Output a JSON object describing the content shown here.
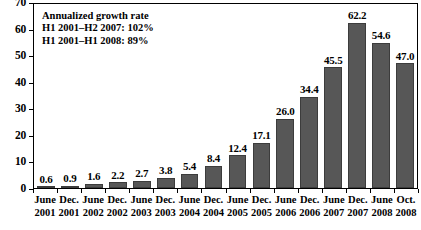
{
  "chart_data": {
    "type": "bar",
    "title": "",
    "xlabel": "",
    "ylabel": "",
    "ylim": [
      0,
      70
    ],
    "yticks": [
      0,
      10,
      20,
      30,
      40,
      50,
      60,
      70
    ],
    "grid": false,
    "legend": null,
    "categories": [
      "June 2001",
      "Dec. 2001",
      "June 2002",
      "Dec. 2002",
      "June 2003",
      "Dec. 2003",
      "June 2004",
      "Dec. 2004",
      "June 2005",
      "Dec. 2005",
      "June 2006",
      "Dec. 2006",
      "June 2007",
      "Dec. 2007",
      "June 2008",
      "Oct. 2008"
    ],
    "category_parts": [
      {
        "month": "June",
        "year": "2001"
      },
      {
        "month": "Dec.",
        "year": "2001"
      },
      {
        "month": "June",
        "year": "2002"
      },
      {
        "month": "Dec.",
        "year": "2002"
      },
      {
        "month": "June",
        "year": "2003"
      },
      {
        "month": "Dec.",
        "year": "2003"
      },
      {
        "month": "June",
        "year": "2004"
      },
      {
        "month": "Dec.",
        "year": "2004"
      },
      {
        "month": "June",
        "year": "2005"
      },
      {
        "month": "Dec.",
        "year": "2005"
      },
      {
        "month": "June",
        "year": "2006"
      },
      {
        "month": "Dec.",
        "year": "2006"
      },
      {
        "month": "June",
        "year": "2007"
      },
      {
        "month": "Dec.",
        "year": "2007"
      },
      {
        "month": "June",
        "year": "2008"
      },
      {
        "month": "Oct.",
        "year": "2008"
      }
    ],
    "values": [
      0.6,
      0.9,
      1.6,
      2.2,
      2.7,
      3.8,
      5.4,
      8.4,
      12.4,
      17.1,
      26.0,
      34.4,
      45.5,
      62.2,
      54.6,
      47.0
    ],
    "value_labels": [
      "0.6",
      "0.9",
      "1.6",
      "2.2",
      "2.7",
      "3.8",
      "5.4",
      "8.4",
      "12.4",
      "17.1",
      "26.0",
      "34.4",
      "45.5",
      "62.2",
      "54.6",
      "47.0"
    ],
    "annotations": [
      "Annualized growth rate",
      "H1 2001–H2 2007: 102%",
      "H1 2001–H1 2008: 89%"
    ],
    "colors": {
      "bar_fill": "#575757",
      "bar_edge": "#3c3c3c",
      "axis": "#000000",
      "background": "#ffffff",
      "text": "#000000"
    }
  }
}
